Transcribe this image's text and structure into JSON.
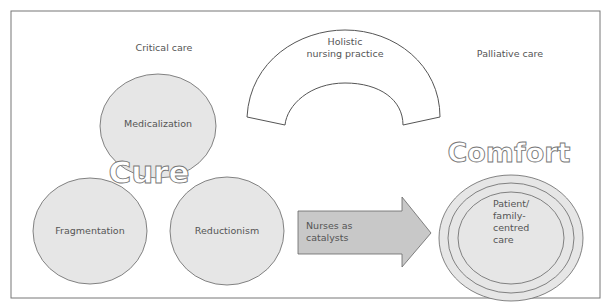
{
  "diagram": {
    "labels": {
      "critical_care": "Critical care",
      "palliative_care": "Palliative care",
      "holistic_line1": "Holistic",
      "holistic_line2": "nursing practice",
      "cure": "Cure",
      "comfort": "Comfort",
      "medicalization": "Medicalization",
      "fragmentation": "Fragmentation",
      "reductionism": "Reductionism",
      "nurses_line1": "Nurses as",
      "nurses_line2": "catalysts",
      "patient_line1": "Patient/",
      "patient_line2": "family-",
      "patient_line3": "centred",
      "patient_line4": "care"
    },
    "colors": {
      "circle_fill": "#e6e6e6",
      "arrow_fill": "#c8c8c8",
      "stroke": "#666666",
      "border": "#777777",
      "text": "#555555",
      "comfort_ring_fill": "#ffffff"
    }
  }
}
